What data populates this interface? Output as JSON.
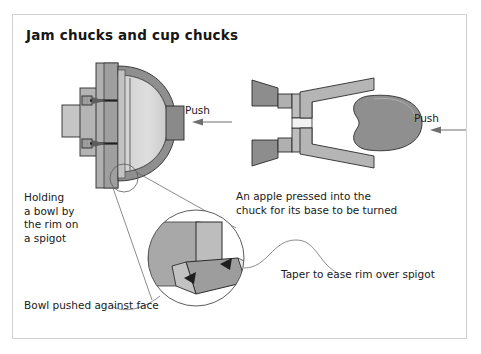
{
  "figure": {
    "title": "Jam chucks and cup chucks",
    "border_color": "#d2d2d4",
    "background": "#ffffff"
  },
  "illustrations": {
    "left": {
      "name": "bowl-on-spigot-cross-section",
      "push_label": "Push",
      "arrow_direction": "left",
      "parts": [
        "lathe-spindle",
        "faceplate",
        "wooden-spigot-chuck",
        "bowl-cross-section",
        "tailstock-center",
        "screw-upper",
        "screw-lower"
      ]
    },
    "right": {
      "name": "apple-in-cup-chuck-cross-section",
      "push_label": "Push",
      "arrow_direction": "left",
      "parts": [
        "lathe-drive-spindle",
        "cup-chuck",
        "apple-blank",
        "tailstock"
      ]
    },
    "detail": {
      "name": "spigot-rim-detail-magnified",
      "arrows": 2
    }
  },
  "captions": {
    "holding": "Holding\na bowl by\nthe rim on\na spigot",
    "apple": "An apple pressed into the\nchuck for its base to be turned",
    "taper": "Taper to ease rim over spigot",
    "bowl_pushed": "Bowl pushed against face"
  },
  "colors": {
    "wood_dark": "#8d8d8d",
    "wood_mid": "#a6a6a6",
    "wood_light": "#c9c9c9",
    "wood_pale": "#dcdcdc",
    "bowl_interior": "#d8d8d8",
    "outline": "#2b2b2b",
    "arrow": "#6f6f6f",
    "leader": "#5a5a5a",
    "text": "#202020"
  }
}
